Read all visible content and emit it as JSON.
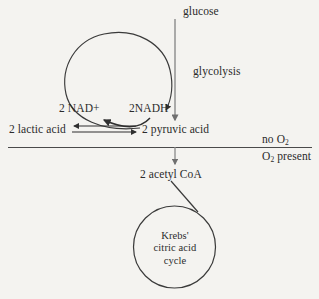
{
  "diagram": {
    "background_color": "#f4f3f0",
    "stroke_color": "#3a3a3a",
    "text_color": "#2b2b2b",
    "labels": {
      "glucose": "glucose",
      "glycolysis": "glycolysis",
      "nad_plus": "2 NAD+",
      "nadh": "2NADH",
      "lactic_acid": "2 lactic acid",
      "pyruvic_acid": "2 pyruvic acid",
      "no_oxygen": "no O",
      "no_oxygen_sub": "2",
      "oxygen_present_prefix": "O",
      "oxygen_present_sub": "2",
      "oxygen_present_suffix": " present",
      "acetyl_coa": "2 acetyl CoA",
      "krebs_line1": "Krebs'",
      "krebs_line2": "citric acid",
      "krebs_line3": "cycle"
    },
    "arrows": {
      "glucose_to_pyruvate": "vertical arrow downward from glucose to 2 pyruvic acid",
      "nad_loop": "counterclockwise circular arrow from NADH region up and around to 2NADH",
      "nadh_to_nad": "curved arrow from 2NADH leftward to 2 NAD+",
      "lactic_to_pyruvic": "arrow right from 2 lactic acid to 2 pyruvic acid",
      "pyruvic_to_lactic": "arrow left from 2 pyruvic acid to 2 lactic acid",
      "pyruvate_to_acetyl": "short vertical arrow downward to 2 acetyl CoA",
      "acetyl_to_krebs": "diagonal line from 2 acetyl CoA to Krebs cycle circle"
    },
    "divider": {
      "name": "oxygen-condition-divider",
      "description": "horizontal line separating anaerobic (no O2) from aerobic (O2 present)"
    },
    "krebs_circle": {
      "name": "krebs-cycle-circle",
      "cx": 174.5,
      "cy": 247,
      "r": 41
    }
  }
}
